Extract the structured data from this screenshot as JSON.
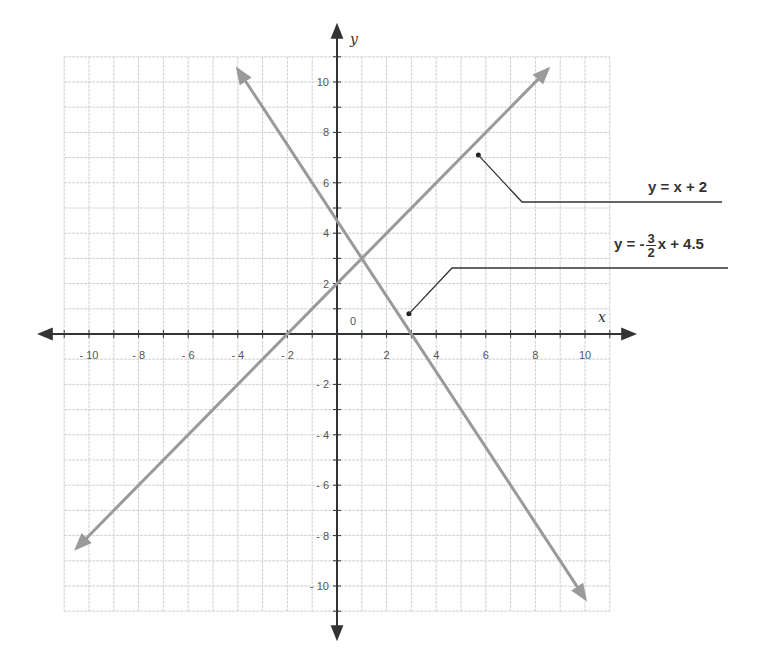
{
  "chart_data": {
    "type": "line",
    "title": "",
    "xlabel": "x",
    "ylabel": "y",
    "xlim": [
      -11,
      11
    ],
    "ylim": [
      -11,
      11
    ],
    "grid": true,
    "origin_label": "0",
    "x_tick_labels": [
      "-10",
      "-8",
      "-6",
      "-4",
      "-2",
      "2",
      "4",
      "6",
      "8",
      "10"
    ],
    "y_tick_labels": [
      "10",
      "8",
      "6",
      "4",
      "2",
      "-2",
      "-4",
      "-6",
      "-8",
      "-10"
    ],
    "series": [
      {
        "name": "y = x + 2",
        "slope": 1,
        "intercept": 2,
        "x": [
          -10.5,
          8.5
        ],
        "y": [
          -8.5,
          10.5
        ],
        "color": "#9a9a9a"
      },
      {
        "name": "y = -3/2 x + 4.5",
        "slope": -1.5,
        "intercept": 4.5,
        "x": [
          -4,
          10
        ],
        "y": [
          10.5,
          -10.5
        ],
        "color": "#9a9a9a"
      }
    ],
    "intersection": {
      "x": 1,
      "y": 3
    },
    "annotations": [
      {
        "text": "y = x + 2",
        "points_to": [
          5.7,
          7.1
        ]
      },
      {
        "text": "y = -3/2 x + 4.5",
        "points_to": [
          2.9,
          0.8
        ]
      }
    ]
  },
  "labels": {
    "x_axis": "x",
    "y_axis": "y",
    "origin": "0",
    "eq1": {
      "lhs": "y = x + 2"
    },
    "eq2": {
      "lhs": "y = -",
      "num": "3",
      "den": "2",
      "rhs": "x + 4.5"
    }
  }
}
